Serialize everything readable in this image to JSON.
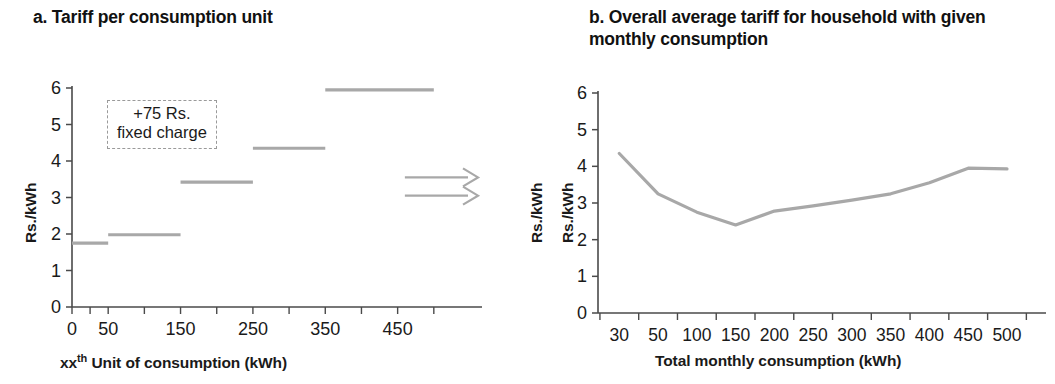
{
  "figure": {
    "background": "#ffffff",
    "line_color": "#a8a8a8",
    "axis_color": "#4a4a4a"
  },
  "panel_a": {
    "title": "a. Tariff per consumption unit",
    "ylabel": "Rs./kWh",
    "ylabel_right": "Rs./kWh",
    "xlabel_prefix": "xx",
    "xlabel_sup": "th",
    "xlabel_rest": " Unit of consumption (kWh)",
    "annotation": "+75 Rs.\nfixed charge",
    "ytick_labels": [
      "6",
      "5",
      "4",
      "3",
      "2",
      "1",
      "0"
    ],
    "xtick_labels": [
      "0",
      "50",
      "150",
      "250",
      "350",
      "450"
    ],
    "arrows": 2
  },
  "panel_b": {
    "title": "b. Overall average tariff for household with given\n    monthly consumption",
    "ylabel": "Rs./kWh",
    "xlabel": "Total monthly consumption (kWh)",
    "ytick_labels": [
      "6",
      "5",
      "4",
      "3",
      "2",
      "1",
      "0"
    ],
    "xtick_labels": [
      "30",
      "50",
      "100",
      "150",
      "200",
      "250",
      "300",
      "350",
      "400",
      "450",
      "500"
    ]
  },
  "chart_data": [
    {
      "type": "line",
      "id": "panel_a",
      "title": "a. Tariff per consumption unit",
      "xlabel": "xx-th Unit of consumption (kWh)",
      "ylabel": "Rs./kWh",
      "ylim": [
        0,
        6
      ],
      "xlim": [
        0,
        550
      ],
      "grid": false,
      "legend": null,
      "description": "Step function: marginal tariff per unit by consumption slab",
      "xtick_labels": [
        "0",
        "50",
        "150",
        "250",
        "350",
        "450"
      ],
      "ytick_values": [
        0,
        1,
        2,
        3,
        4,
        5,
        6
      ],
      "steps": [
        {
          "x_start": 0,
          "x_end": 50,
          "value": 1.75,
          "label": "0-50 kWh"
        },
        {
          "x_start": 50,
          "x_end": 150,
          "value": 1.98,
          "label": "50-150 kWh"
        },
        {
          "x_start": 150,
          "x_end": 250,
          "value": 3.42,
          "label": "150-250 kWh"
        },
        {
          "x_start": 250,
          "x_end": 350,
          "value": 4.35,
          "label": "250-350 kWh"
        },
        {
          "x_start": 350,
          "x_end": 500,
          "value": 5.95,
          "label": "350+ kWh"
        }
      ],
      "annotations": [
        {
          "text": "+75 Rs. fixed charge",
          "x": 110,
          "y": 4.9,
          "style": "dashed-box"
        }
      ],
      "arrows": [
        {
          "y": 3.55,
          "x_start": 460,
          "x_end": 550,
          "direction": "right"
        },
        {
          "y": 3.05,
          "x_start": 460,
          "x_end": 550,
          "direction": "right"
        }
      ]
    },
    {
      "type": "line",
      "id": "panel_b",
      "title": "b. Overall average tariff for household with given monthly consumption",
      "xlabel": "Total monthly consumption (kWh)",
      "ylabel": "Rs./kWh",
      "ylim": [
        0,
        6
      ],
      "grid": false,
      "legend": null,
      "description": "Average tariff (including 75 Rs. fixed charge) vs total monthly consumption",
      "categories": [
        30,
        50,
        100,
        150,
        200,
        250,
        300,
        350,
        400,
        450,
        500
      ],
      "values": [
        4.35,
        3.25,
        2.75,
        2.4,
        2.78,
        2.92,
        3.08,
        3.25,
        3.55,
        3.95,
        3.93
      ],
      "ytick_values": [
        0,
        1,
        2,
        3,
        4,
        5,
        6
      ]
    }
  ]
}
